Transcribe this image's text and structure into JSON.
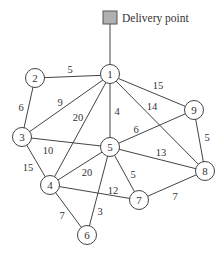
{
  "diagram": {
    "type": "weighted-undirected-graph",
    "delivery_point": {
      "label": "Delivery point",
      "connected_to": "1",
      "color": "#b0b0b0"
    },
    "nodes": [
      {
        "id": "1",
        "label": "1"
      },
      {
        "id": "2",
        "label": "2"
      },
      {
        "id": "3",
        "label": "3"
      },
      {
        "id": "4",
        "label": "4"
      },
      {
        "id": "5",
        "label": "5"
      },
      {
        "id": "6",
        "label": "6"
      },
      {
        "id": "7",
        "label": "7"
      },
      {
        "id": "8",
        "label": "8"
      },
      {
        "id": "9",
        "label": "9"
      }
    ],
    "edges": [
      {
        "from": "1",
        "to": "2",
        "weight": "5"
      },
      {
        "from": "1",
        "to": "3",
        "weight": "9"
      },
      {
        "from": "1",
        "to": "4",
        "weight": "20"
      },
      {
        "from": "1",
        "to": "5",
        "weight": "4"
      },
      {
        "from": "1",
        "to": "8",
        "weight": "14"
      },
      {
        "from": "1",
        "to": "9",
        "weight": "15"
      },
      {
        "from": "2",
        "to": "3",
        "weight": "6"
      },
      {
        "from": "3",
        "to": "5",
        "weight": "10"
      },
      {
        "from": "3",
        "to": "4",
        "weight": "15"
      },
      {
        "from": "4",
        "to": "5",
        "weight": "20"
      },
      {
        "from": "4",
        "to": "7",
        "weight": "12"
      },
      {
        "from": "4",
        "to": "6",
        "weight": "7"
      },
      {
        "from": "5",
        "to": "9",
        "weight": "6"
      },
      {
        "from": "5",
        "to": "8",
        "weight": "13"
      },
      {
        "from": "5",
        "to": "7",
        "weight": "5"
      },
      {
        "from": "5",
        "to": "6",
        "weight": "3"
      },
      {
        "from": "7",
        "to": "8",
        "weight": "7"
      },
      {
        "from": "8",
        "to": "9",
        "weight": "5"
      }
    ]
  }
}
